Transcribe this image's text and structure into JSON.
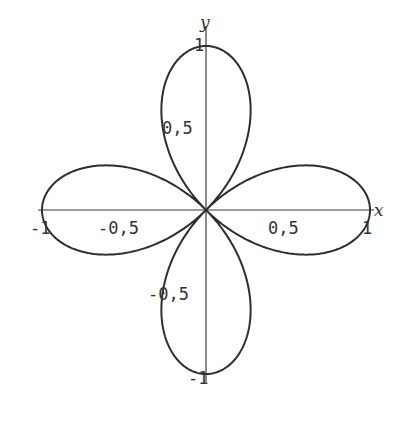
{
  "chart_data": {
    "type": "line",
    "title": "",
    "xlabel": "x",
    "ylabel": "y",
    "equation": "r = cos(2θ)",
    "curve_type": "polar rose, 4 petals",
    "xlim": [
      -1,
      1
    ],
    "ylim": [
      -1,
      1
    ],
    "grid": false,
    "x_ticks": [
      {
        "value": -1,
        "label": "-1"
      },
      {
        "value": -0.5,
        "label": "-0,5"
      },
      {
        "value": 0.5,
        "label": "0,5"
      },
      {
        "value": 1,
        "label": "1"
      }
    ],
    "y_ticks": [
      {
        "value": 1,
        "label": "1"
      },
      {
        "value": 0.5,
        "label": "0,5"
      },
      {
        "value": -0.5,
        "label": "-0,5"
      },
      {
        "value": -1,
        "label": "-1"
      }
    ],
    "petal_tips": [
      {
        "x": 1,
        "y": 0
      },
      {
        "x": 0,
        "y": 1
      },
      {
        "x": -1,
        "y": 0
      },
      {
        "x": 0,
        "y": -1
      }
    ],
    "colors": {
      "curve": "#2e2e2e",
      "axis": "#3a3a3a"
    }
  },
  "labels": {
    "x_axis": "x",
    "y_axis": "y",
    "xt_m1": "-1",
    "xt_m05": "-0,5",
    "xt_05": "0,5",
    "xt_1": "1",
    "yt_1": "1",
    "yt_05": "0,5",
    "yt_m05": "-0,5",
    "yt_m1": "-1"
  }
}
